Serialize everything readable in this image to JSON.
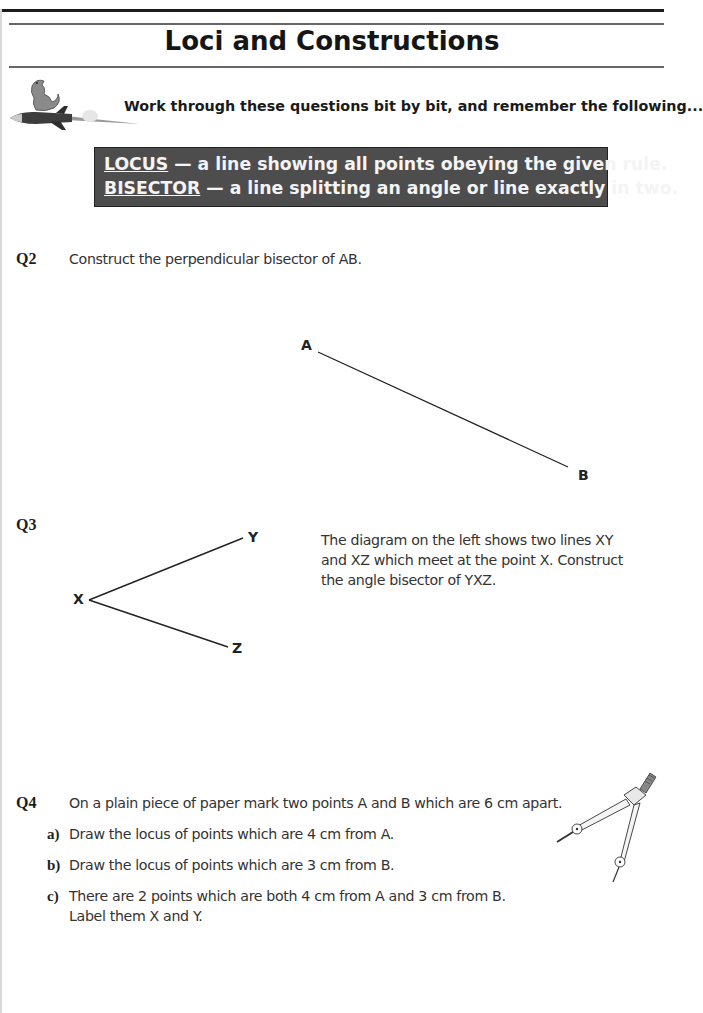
{
  "page": {
    "title": "Loci and Constructions",
    "intro": "Work through these questions bit by bit, and remember the following...",
    "definitions": [
      {
        "term": "LOCUS",
        "text": " — a line showing all points obeying the given rule."
      },
      {
        "term": "BISECTOR",
        "text": " — a line splitting an angle or line exactly in two."
      }
    ],
    "mascot_icon": "dinosaur-on-rocket-icon"
  },
  "questions": {
    "q2": {
      "label": "Q2",
      "text": "Construct the perpendicular bisector of AB.",
      "diagram": {
        "point_a": "A",
        "point_b": "B"
      }
    },
    "q3": {
      "label": "Q3",
      "text_lines": [
        "The diagram on the left shows two lines XY",
        "and XZ which meet at the point X.  Construct",
        "the angle bisector of YXZ."
      ],
      "diagram": {
        "point_x": "X",
        "point_y": "Y",
        "point_z": "Z"
      }
    },
    "q4": {
      "label": "Q4",
      "text": "On a plain piece of paper mark two points A and B which are 6 cm apart.",
      "parts": [
        {
          "label": "a)",
          "lines": [
            "Draw the locus of points which are 4 cm from A."
          ]
        },
        {
          "label": "b)",
          "lines": [
            "Draw the locus of points which are 3 cm from B."
          ]
        },
        {
          "label": "c)",
          "lines": [
            "There are 2 points which are both 4 cm from A and 3 cm from B.",
            "Label them X and Y."
          ]
        }
      ],
      "illustration_icon": "compass-drawing-tool-icon"
    }
  }
}
